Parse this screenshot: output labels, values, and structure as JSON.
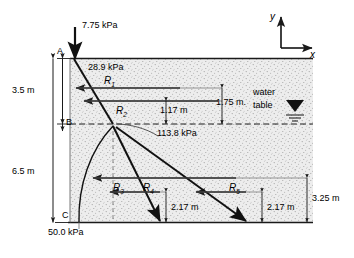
{
  "figure": {
    "type": "engineering-soil-pressure-diagram",
    "axes": {
      "y_label": "y",
      "x_label": "x"
    },
    "strata": {
      "top_marker": "A",
      "middle_marker": "B",
      "bottom_marker": "C",
      "upper_depth": "3.5 m",
      "lower_depth": "6.5 m"
    },
    "pressures": {
      "surcharge_top": "7.75 kPa",
      "at_A_below": "28.9 kPa",
      "at_B": "113.8  kPa",
      "at_C": "50.0 kPa"
    },
    "water_table": {
      "line1": "water",
      "line2": "table"
    },
    "resultants": [
      {
        "name": "R",
        "index": "1"
      },
      {
        "name": "R",
        "index": "2"
      },
      {
        "name": "R",
        "index": "3"
      },
      {
        "name": "R",
        "index": "4"
      },
      {
        "name": "R",
        "index": "5"
      }
    ],
    "dimensions": {
      "d_117": "1.17 m",
      "d_175": "1.75 m.",
      "d_217_left": "2.17 m",
      "d_217_right": "2.17 m",
      "d_325": "3.25 m"
    },
    "colors": {
      "soil_fill": "#e9e9e9",
      "stipple": "#9a9a9a",
      "line": "#1a1a1a",
      "thin_line": "#4a4a4a",
      "background": "#ffffff"
    }
  }
}
